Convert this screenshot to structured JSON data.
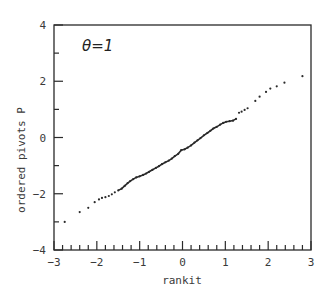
{
  "chart_data": {
    "type": "scatter",
    "title": "",
    "annotation": "θ=1",
    "xlabel": "rankit",
    "ylabel": "ordered pivots  P",
    "xlim": [
      -3,
      3
    ],
    "ylim": [
      -4,
      4
    ],
    "x_ticks": [
      -3,
      -2,
      -1,
      0,
      1,
      2,
      3
    ],
    "y_ticks": [
      -4,
      -2,
      0,
      2,
      4
    ],
    "x_minor_step": 0.2,
    "y_minor_step": 1,
    "grid": false,
    "legend": null,
    "colors": {
      "points": "#2a2a2a",
      "axes": "#2a2a2a",
      "text": "#3a3a3a"
    },
    "series": [
      {
        "name": "ordered pivots",
        "points": [
          [
            -2.75,
            -3.0
          ],
          [
            -2.4,
            -2.65
          ],
          [
            -2.2,
            -2.5
          ],
          [
            -2.05,
            -2.3
          ],
          [
            -1.95,
            -2.2
          ],
          [
            -1.88,
            -2.15
          ],
          [
            -1.8,
            -2.12
          ],
          [
            -1.72,
            -2.08
          ],
          [
            -1.65,
            -2.02
          ],
          [
            -1.58,
            -1.95
          ],
          [
            -1.5,
            -1.88
          ],
          [
            -1.42,
            -1.82
          ],
          [
            -1.35,
            -1.72
          ],
          [
            -1.28,
            -1.62
          ],
          [
            -1.22,
            -1.55
          ],
          [
            -1.15,
            -1.48
          ],
          [
            -1.08,
            -1.42
          ],
          [
            -1.0,
            -1.38
          ],
          [
            -0.92,
            -1.33
          ],
          [
            -0.85,
            -1.28
          ],
          [
            -0.78,
            -1.22
          ],
          [
            -0.7,
            -1.15
          ],
          [
            -0.62,
            -1.08
          ],
          [
            -0.55,
            -1.02
          ],
          [
            -0.48,
            -0.95
          ],
          [
            -0.4,
            -0.88
          ],
          [
            -0.32,
            -0.82
          ],
          [
            -0.25,
            -0.75
          ],
          [
            -0.18,
            -0.66
          ],
          [
            -0.1,
            -0.58
          ],
          [
            -0.03,
            -0.45
          ],
          [
            0.05,
            -0.42
          ],
          [
            0.12,
            -0.36
          ],
          [
            0.2,
            -0.28
          ],
          [
            0.28,
            -0.18
          ],
          [
            0.35,
            -0.1
          ],
          [
            0.42,
            -0.02
          ],
          [
            0.5,
            0.08
          ],
          [
            0.58,
            0.16
          ],
          [
            0.65,
            0.24
          ],
          [
            0.72,
            0.32
          ],
          [
            0.8,
            0.38
          ],
          [
            0.88,
            0.46
          ],
          [
            0.95,
            0.52
          ],
          [
            1.02,
            0.56
          ],
          [
            1.1,
            0.58
          ],
          [
            1.18,
            0.6
          ],
          [
            1.25,
            0.66
          ],
          [
            1.32,
            0.88
          ],
          [
            1.38,
            0.92
          ],
          [
            1.45,
            0.98
          ],
          [
            1.52,
            1.04
          ],
          [
            1.7,
            1.3
          ],
          [
            1.8,
            1.45
          ],
          [
            1.95,
            1.62
          ],
          [
            2.05,
            1.74
          ],
          [
            2.2,
            1.82
          ],
          [
            2.38,
            1.95
          ],
          [
            2.8,
            2.18
          ]
        ]
      }
    ]
  }
}
